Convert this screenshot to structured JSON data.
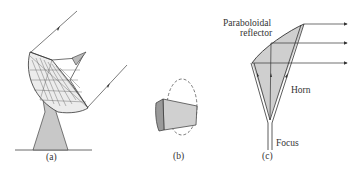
{
  "figure": {
    "panels": [
      {
        "id": "a",
        "caption": "(a)",
        "description": "Parabolic dish antenna on pedestal with incoming parallel rays"
      },
      {
        "id": "b",
        "caption": "(b)",
        "description": "Curved aperture section within dashed ellipse"
      },
      {
        "id": "c",
        "caption": "(c)",
        "description": "Horn-fed paraboloidal reflector section",
        "labels": {
          "reflector": [
            "Paraboloidal",
            "reflector"
          ],
          "horn": "Horn",
          "focus": "Focus"
        }
      }
    ],
    "colors": {
      "line": "#333333",
      "fill_light": "#cfcfcf",
      "fill_dark": "#9a9a9a",
      "background": "#ffffff"
    }
  }
}
